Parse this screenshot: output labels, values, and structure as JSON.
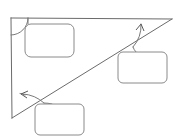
{
  "diagram": {
    "canvas": {
      "width": 177,
      "height": 139,
      "background": "#ffffff"
    },
    "stroke_color": "#6b6b6b",
    "annotation_color": "#7a7a7a",
    "box_stroke_color": "#8a8a8a",
    "box_fill_color": "#ffffff",
    "shape": {
      "name": "right-triangle",
      "vertices": [
        {
          "id": "top-left",
          "x": 11,
          "y": 18,
          "label": ""
        },
        {
          "id": "top-right",
          "x": 172,
          "y": 19,
          "label": ""
        },
        {
          "id": "bottom-left",
          "x": 12,
          "y": 118,
          "label": ""
        }
      ],
      "edges": [
        {
          "id": "top-edge",
          "from": "top-left",
          "to": "top-right"
        },
        {
          "id": "left-edge",
          "from": "top-left",
          "to": "bottom-left"
        },
        {
          "id": "hypotenuse",
          "from": "bottom-left",
          "to": "top-right"
        }
      ]
    },
    "angle_markers": [
      {
        "id": "angle-top-left",
        "vertex": "top-left",
        "arrow": false,
        "label": ""
      },
      {
        "id": "angle-bottom-left",
        "vertex": "bottom-left",
        "arrow": true,
        "label": ""
      },
      {
        "id": "angle-top-right",
        "vertex": "top-right",
        "arrow": true,
        "label": ""
      }
    ],
    "callouts": [
      {
        "id": "callout-top-left",
        "linked_angle": "angle-top-left",
        "text": "",
        "x": 25,
        "y": 24,
        "width": 49,
        "height": 33,
        "radius": 6
      },
      {
        "id": "callout-right",
        "linked_angle": "angle-top-right",
        "text": "",
        "x": 118,
        "y": 52,
        "width": 49,
        "height": 31,
        "radius": 5
      },
      {
        "id": "callout-bottom",
        "linked_angle": "angle-bottom-left",
        "text": "",
        "x": 35,
        "y": 104,
        "width": 49,
        "height": 31,
        "radius": 5
      }
    ]
  }
}
